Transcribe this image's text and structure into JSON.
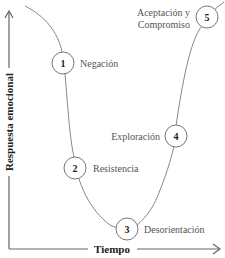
{
  "diagram": {
    "type": "change-curve",
    "axes": {
      "y_label": "Respuesta emocional",
      "x_label": "Tiempo"
    },
    "stages": [
      {
        "number": "1",
        "label": "Negación"
      },
      {
        "number": "2",
        "label": "Resistencia"
      },
      {
        "number": "3",
        "label": "Desorientación"
      },
      {
        "number": "4",
        "label": "Exploración"
      },
      {
        "number": "5",
        "label_line1": "Aceptación y",
        "label_line2": "Compromiso"
      }
    ],
    "colors": {
      "curve": "#888888",
      "circle_stroke": "#777777",
      "axis": "#666666",
      "text": "#555555",
      "axis_text": "#222222"
    }
  }
}
